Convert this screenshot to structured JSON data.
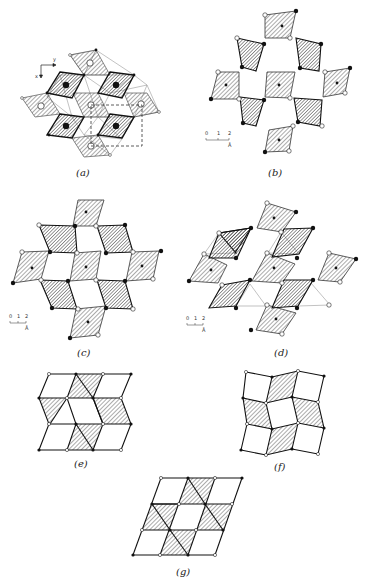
{
  "figure": {
    "panels": [
      {
        "id": "a",
        "label": "(a)",
        "axes": {
          "x": "x",
          "y": "y"
        },
        "has_unit_cell": true
      },
      {
        "id": "b",
        "label": "(b)",
        "scale_bar": {
          "ticks": [
            "0",
            "1",
            "2"
          ],
          "unit": "Å"
        }
      },
      {
        "id": "c",
        "label": "(c)",
        "scale_bar": {
          "ticks": [
            "0",
            "1",
            "2"
          ],
          "unit": "Å"
        }
      },
      {
        "id": "d",
        "label": "(d)",
        "scale_bar": {
          "ticks": [
            "0",
            "1",
            "2"
          ],
          "unit": "Å"
        }
      },
      {
        "id": "e",
        "label": "(e)"
      },
      {
        "id": "f",
        "label": "(f)"
      },
      {
        "id": "g",
        "label": "(g)"
      }
    ],
    "colors": {
      "line": "#222222",
      "hatch": "#444444",
      "background": "#ffffff",
      "open_atom": "#ffffff",
      "filled_atom": "#111111"
    }
  }
}
